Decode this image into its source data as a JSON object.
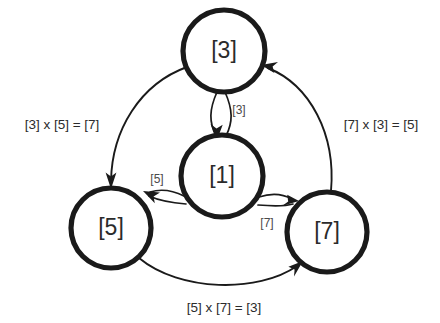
{
  "diagram": {
    "type": "cyclic-group-multiplication-graph",
    "background_color": "#ffffff",
    "stroke_color": "#1a1a1a",
    "text_color": "#2b2b2b",
    "nodes": [
      {
        "id": "n3",
        "label": "[3]",
        "position": "top",
        "cx": 224,
        "cy": 51,
        "r": 41
      },
      {
        "id": "n1",
        "label": "[1]",
        "position": "center",
        "cx": 222,
        "cy": 176,
        "r": 41
      },
      {
        "id": "n5",
        "label": "[5]",
        "position": "left",
        "cx": 111,
        "cy": 228,
        "r": 40
      },
      {
        "id": "n7",
        "label": "[7]",
        "position": "right",
        "cx": 327,
        "cy": 232,
        "r": 40
      }
    ],
    "inner_edge_labels": [
      {
        "id": "e-31",
        "label": "[3]",
        "from": "n3",
        "to": "n1",
        "x": 239,
        "y": 111
      },
      {
        "id": "e-15",
        "label": "[5]",
        "from": "n1",
        "to": "n5",
        "x": 157,
        "y": 180
      },
      {
        "id": "e-17",
        "label": "[7]",
        "from": "n1",
        "to": "n7",
        "x": 267,
        "y": 224
      }
    ],
    "outer_edge_labels": [
      {
        "id": "e-35",
        "label": "[3] x [5] = [7]",
        "from": "n3",
        "to": "n5",
        "x": 62,
        "y": 125
      },
      {
        "id": "e-73",
        "label": "[7] x [3] = [5]",
        "from": "n7",
        "to": "n3",
        "x": 381,
        "y": 125
      },
      {
        "id": "e-57",
        "label": "[5] x [7] = [3]",
        "from": "n5",
        "to": "n7",
        "x": 224,
        "y": 308
      }
    ]
  }
}
